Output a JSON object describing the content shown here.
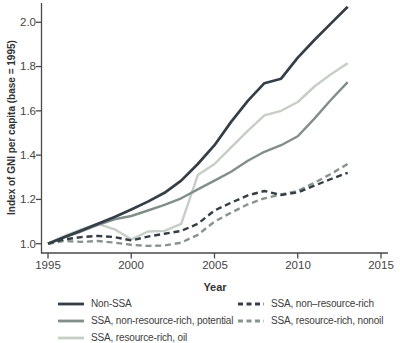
{
  "chart_data": {
    "type": "line",
    "title": "",
    "ylabel": "Index of GNI per capita (base = 1995)",
    "xlabel": "Year",
    "x": [
      1995,
      1996,
      1997,
      1998,
      1999,
      2000,
      2001,
      2002,
      2003,
      2004,
      2005,
      2006,
      2007,
      2008,
      2009,
      2010,
      2011,
      2012,
      2013
    ],
    "xticks": [
      1995,
      2000,
      2005,
      2010,
      2015
    ],
    "xtick_labels": [
      "1995",
      "2000",
      "2005",
      "2010",
      "2015"
    ],
    "yticks": [
      1.0,
      1.2,
      1.4,
      1.6,
      1.8,
      2.0
    ],
    "ytick_labels": [
      "1.0",
      "1.2",
      "1.4",
      "1.6",
      "1.8",
      "2.0"
    ],
    "ylim": [
      0.958,
      2.087
    ],
    "xlim": [
      1995,
      2015.9
    ],
    "grid": false,
    "legend_position": "bottom",
    "axis_color": "#494949",
    "series": [
      {
        "name": "Non-SSA",
        "color": "#333e46",
        "style": "solid",
        "width": 2.7,
        "values": [
          1.0,
          1.03,
          1.06,
          1.09,
          1.12,
          1.155,
          1.19,
          1.23,
          1.285,
          1.36,
          1.445,
          1.55,
          1.645,
          1.725,
          1.745,
          1.84,
          1.92,
          1.995,
          2.07
        ]
      },
      {
        "name": "SSA, non-resource-rich, potential",
        "color": "#828f88",
        "style": "solid",
        "width": 2.4,
        "values": [
          1.0,
          1.03,
          1.055,
          1.085,
          1.11,
          1.125,
          1.15,
          1.175,
          1.205,
          1.245,
          1.285,
          1.325,
          1.375,
          1.415,
          1.445,
          1.485,
          1.565,
          1.65,
          1.73
        ]
      },
      {
        "name": "SSA, resource-rich, oil",
        "color": "#c5cfc6",
        "style": "solid",
        "width": 2.4,
        "values": [
          1.0,
          1.035,
          1.065,
          1.09,
          1.065,
          1.02,
          1.055,
          1.058,
          1.09,
          1.31,
          1.36,
          1.435,
          1.51,
          1.58,
          1.6,
          1.64,
          1.71,
          1.765,
          1.815
        ]
      },
      {
        "name": "SSA, non–resource-rich",
        "color": "#333e46",
        "style": "dashed",
        "width": 2.4,
        "values": [
          1.0,
          1.02,
          1.03,
          1.035,
          1.03,
          1.015,
          1.032,
          1.045,
          1.058,
          1.09,
          1.15,
          1.185,
          1.218,
          1.238,
          1.22,
          1.232,
          1.262,
          1.292,
          1.32
        ]
      },
      {
        "name": "SSA, resource-rich, nonoil",
        "color": "#87948c",
        "style": "dashed",
        "width": 2.4,
        "values": [
          1.0,
          1.012,
          1.008,
          1.012,
          1.005,
          0.995,
          0.99,
          0.992,
          1.005,
          1.04,
          1.1,
          1.14,
          1.178,
          1.205,
          1.222,
          1.238,
          1.275,
          1.315,
          1.36
        ]
      }
    ]
  }
}
